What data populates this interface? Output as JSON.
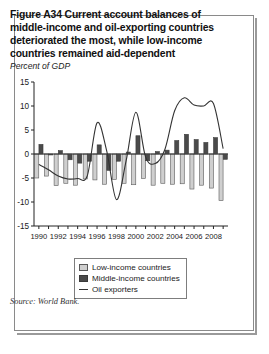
{
  "figure": {
    "title": "Figure A34  Current account balances of middle-income and oil-exporting countries deteriorated the most, while low-income countries remained aid-dependent",
    "subtitle": "Percent of GDP",
    "source": "Source: World Bank."
  },
  "legend": {
    "items": [
      {
        "key": "low",
        "label": "Low-income countries"
      },
      {
        "key": "mid",
        "label": "Middle-income countries"
      },
      {
        "key": "oil",
        "label": "Oil exporters"
      }
    ]
  },
  "colors": {
    "low_income": "#cfcfcf",
    "low_income_edge": "#5a5a5a",
    "middle_income": "#4a4a4a",
    "middle_income_edge": "#3a3a3a",
    "oil_line": "#333333",
    "axis": "#222222",
    "frame": "#8a8a8a"
  },
  "chart_data": {
    "type": "bar",
    "title": "Figure A34  Current account balances of middle-income and oil-exporting countries deteriorated the most, while low-income countries remained aid-dependent",
    "subtitle": "Percent of GDP",
    "xlabel": "",
    "ylabel": "",
    "ylim": [
      -15,
      15
    ],
    "yticks": [
      15,
      10,
      5,
      0,
      -5,
      -10,
      -15
    ],
    "ytick_labels": [
      "15",
      "10",
      "5",
      "0",
      "-5",
      "-10",
      "-15"
    ],
    "grid": false,
    "legend_position": "bottom-center",
    "x": [
      1990,
      1991,
      1992,
      1993,
      1994,
      1995,
      1996,
      1997,
      1998,
      1999,
      2000,
      2001,
      2002,
      2003,
      2004,
      2005,
      2006,
      2007,
      2008,
      2009
    ],
    "xtick_labels": [
      "1990",
      "",
      "1992",
      "",
      "1994",
      "",
      "1996",
      "",
      "1998",
      "",
      "2000",
      "",
      "2002",
      "",
      "2004",
      "",
      "2006",
      "",
      "2008",
      ""
    ],
    "categories": [
      "1990",
      "1991",
      "1992",
      "1993",
      "1994",
      "1995",
      "1996",
      "1997",
      "1998",
      "1999",
      "2000",
      "2001",
      "2002",
      "2003",
      "2004",
      "2005",
      "2006",
      "2007",
      "2008",
      "2009"
    ],
    "series": [
      {
        "name": "Low-income countries",
        "type": "bar",
        "values": [
          -5.0,
          -4.6,
          -6.6,
          -6.1,
          -6.5,
          -5.2,
          -5.4,
          -6.3,
          -5.3,
          -6.1,
          -6.4,
          -5.1,
          -6.5,
          -6.1,
          -6.3,
          -6.2,
          -7.3,
          -6.5,
          -7.1,
          -9.7
        ]
      },
      {
        "name": "Middle-income countries",
        "type": "bar",
        "values": [
          2.0,
          -0.2,
          0.7,
          -1.2,
          -1.9,
          -1.5,
          1.9,
          -3.4,
          -1.5,
          0.4,
          3.8,
          -1.4,
          0.5,
          0.8,
          2.8,
          4.1,
          3.0,
          2.4,
          3.4,
          -1.1
        ]
      },
      {
        "name": "Oil exporters",
        "type": "line",
        "values": [
          -2.2,
          -3.3,
          -4.6,
          -5.2,
          -5.1,
          -4.5,
          6.5,
          0.6,
          -9.5,
          -1.4,
          8.7,
          -0.6,
          -2.0,
          1.0,
          9.0,
          11.7,
          10.2,
          10.0,
          10.5,
          1.1
        ]
      }
    ]
  }
}
